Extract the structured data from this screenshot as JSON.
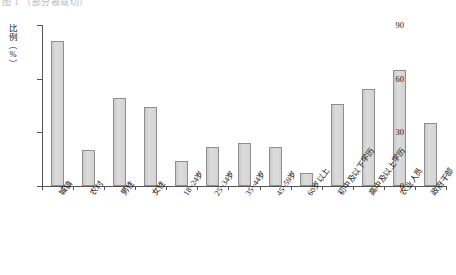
{
  "figure": {
    "caption": "图 1    （部分被裁切）"
  },
  "chart_data": {
    "type": "bar",
    "title": "",
    "xlabel": "",
    "ylabel": "比例（%）",
    "ylabel_chars": [
      "比",
      "例",
      "（",
      "%",
      "）"
    ],
    "ylim": [
      0,
      90
    ],
    "yticks": [
      0,
      30,
      60,
      90
    ],
    "ytick_labels": [
      "0",
      "30",
      "60",
      "90"
    ],
    "grid": false,
    "legend": "none",
    "bar_color": "#d2d2d2",
    "bar_border_color": "#8e8e8e",
    "axis_color": "#555555",
    "categories": [
      "城镇",
      "农村",
      "男性",
      "女性",
      "18~24岁",
      "25~34岁",
      "35~44岁",
      "45~59岁",
      "60岁以上",
      "初中及以下学历",
      "高中及以上学历",
      "农业人员",
      "政府干部"
    ],
    "values": [
      81,
      20,
      49,
      44,
      14,
      22,
      24,
      22,
      7,
      46,
      54,
      65,
      35
    ]
  }
}
